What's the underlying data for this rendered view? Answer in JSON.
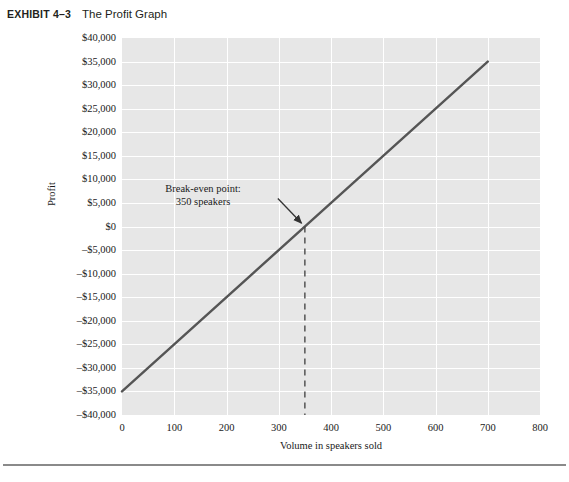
{
  "exhibit": {
    "number": "EXHIBIT 4–3",
    "title": "The Profit Graph"
  },
  "chart_data": {
    "type": "line",
    "title": "The Profit Graph",
    "xlabel": "Volume in speakers sold",
    "ylabel": "Profit",
    "xlim": [
      0,
      800
    ],
    "ylim": [
      -40000,
      40000
    ],
    "grid": true,
    "legend": "none",
    "x_ticks": [
      0,
      100,
      200,
      300,
      400,
      500,
      600,
      700,
      800
    ],
    "x_tick_labels": [
      "0",
      "100",
      "200",
      "300",
      "400",
      "500",
      "600",
      "700",
      "800"
    ],
    "y_ticks": [
      40000,
      35000,
      30000,
      25000,
      20000,
      15000,
      10000,
      5000,
      0,
      -5000,
      -10000,
      -15000,
      -20000,
      -25000,
      -30000,
      -35000,
      -40000
    ],
    "y_tick_labels": [
      "$40,000",
      "$35,000",
      "$30,000",
      "$25,000",
      "$20,000",
      "$15,000",
      "$10,000",
      "$5,000",
      "$0",
      "–$5,000",
      "–$10,000",
      "–$15,000",
      "–$20,000",
      "–$25,000",
      "–$30,000",
      "–$35,000",
      "–$40,000"
    ],
    "series": [
      {
        "name": "Profit",
        "x": [
          0,
          700
        ],
        "y": [
          -35000,
          35000
        ],
        "color": "#555555",
        "fixed_expenses": 35000,
        "unit_contribution_margin": 100
      }
    ],
    "annotations": [
      {
        "name": "break-even-point",
        "text_line_1": "Break-even point:",
        "text_line_2": "350 speakers",
        "x": 350,
        "y": 0,
        "marker": "arrow-with-dashed-dropline"
      }
    ],
    "colors": {
      "plot_background": "#e7e7e7",
      "gridline": "#ffffff",
      "line": "#555555",
      "annotation": "#1a1a1a"
    }
  },
  "footer": {
    "rule": ""
  }
}
